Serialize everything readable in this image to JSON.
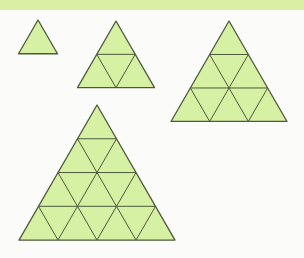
{
  "colors": {
    "band": "#d9efa3",
    "fill": "#d6f0a4",
    "stroke": "#4d5a3c",
    "background": "#fbfcf9"
  },
  "triangles": [
    {
      "name": "triangle-size-1",
      "rows": 1,
      "apex": [
        38,
        20
      ],
      "side": 39
    },
    {
      "name": "triangle-size-2",
      "rows": 2,
      "apex": [
        116,
        21
      ],
      "side": 77
    },
    {
      "name": "triangle-size-3",
      "rows": 3,
      "apex": [
        229,
        21
      ],
      "side": 116
    },
    {
      "name": "triangle-size-4",
      "rows": 4,
      "apex": [
        97,
        105
      ],
      "side": 156
    }
  ]
}
